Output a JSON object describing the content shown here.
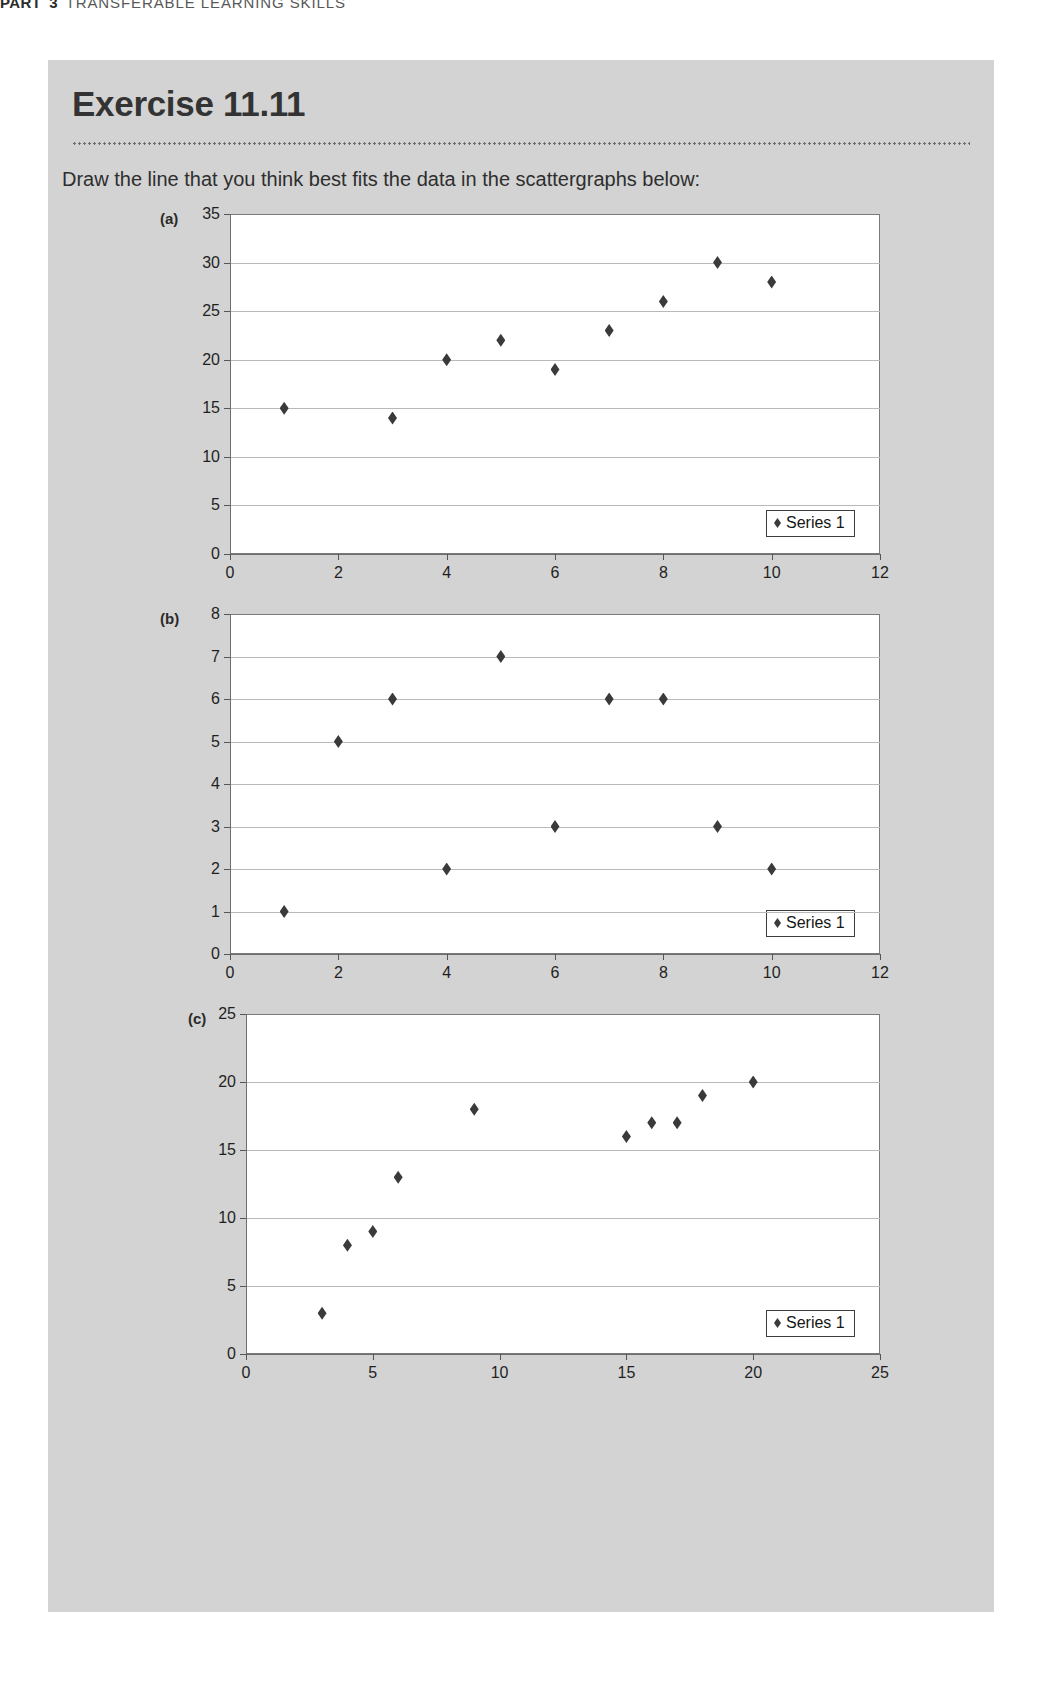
{
  "running_header": {
    "part_word": "PART",
    "part_number": "3",
    "title": "TRANSFERABLE LEARNING SKILLS"
  },
  "exercise": {
    "title": "Exercise 11.11",
    "instruction": "Draw the line that you think best fits the data in the scattergraphs below:"
  },
  "charts": [
    {
      "label": "(a)",
      "legend": "Series 1"
    },
    {
      "label": "(b)",
      "legend": "Series 1"
    },
    {
      "label": "(c)",
      "legend": "Series 1"
    }
  ],
  "chart_data": [
    {
      "type": "scatter",
      "title": "(a)",
      "xlabel": "",
      "ylabel": "",
      "xlim": [
        0,
        12
      ],
      "ylim": [
        0,
        35
      ],
      "xticks": [
        0,
        2,
        4,
        6,
        8,
        10,
        12
      ],
      "yticks": [
        0,
        5,
        10,
        15,
        20,
        25,
        30,
        35
      ],
      "grid": true,
      "legend": [
        "Series 1"
      ],
      "legend_position": "bottom-right",
      "series": [
        {
          "name": "Series 1",
          "points": [
            [
              1,
              15
            ],
            [
              3,
              14
            ],
            [
              4,
              20
            ],
            [
              5,
              22
            ],
            [
              6,
              19
            ],
            [
              7,
              23
            ],
            [
              8,
              26
            ],
            [
              9,
              30
            ],
            [
              10,
              28
            ]
          ]
        }
      ]
    },
    {
      "type": "scatter",
      "title": "(b)",
      "xlabel": "",
      "ylabel": "",
      "xlim": [
        0,
        12
      ],
      "ylim": [
        0,
        8
      ],
      "xticks": [
        0,
        2,
        4,
        6,
        8,
        10,
        12
      ],
      "yticks": [
        0,
        1,
        2,
        3,
        4,
        5,
        6,
        7,
        8
      ],
      "grid": true,
      "legend": [
        "Series 1"
      ],
      "legend_position": "bottom-right",
      "series": [
        {
          "name": "Series 1",
          "points": [
            [
              1,
              1
            ],
            [
              2,
              5
            ],
            [
              3,
              6
            ],
            [
              4,
              2
            ],
            [
              5,
              7
            ],
            [
              6,
              3
            ],
            [
              7,
              6
            ],
            [
              8,
              6
            ],
            [
              9,
              3
            ],
            [
              10,
              2
            ]
          ]
        }
      ]
    },
    {
      "type": "scatter",
      "title": "(c)",
      "xlabel": "",
      "ylabel": "",
      "xlim": [
        0,
        25
      ],
      "ylim": [
        0,
        25
      ],
      "xticks": [
        0,
        5,
        10,
        15,
        20,
        25
      ],
      "yticks": [
        0,
        5,
        10,
        15,
        20,
        25
      ],
      "grid": true,
      "legend": [
        "Series 1"
      ],
      "legend_position": "bottom-right",
      "series": [
        {
          "name": "Series 1",
          "points": [
            [
              3,
              3
            ],
            [
              4,
              8
            ],
            [
              5,
              9
            ],
            [
              6,
              13
            ],
            [
              9,
              18
            ],
            [
              15,
              16
            ],
            [
              16,
              17
            ],
            [
              17,
              17
            ],
            [
              18,
              19
            ],
            [
              20,
              20
            ]
          ]
        }
      ]
    }
  ]
}
